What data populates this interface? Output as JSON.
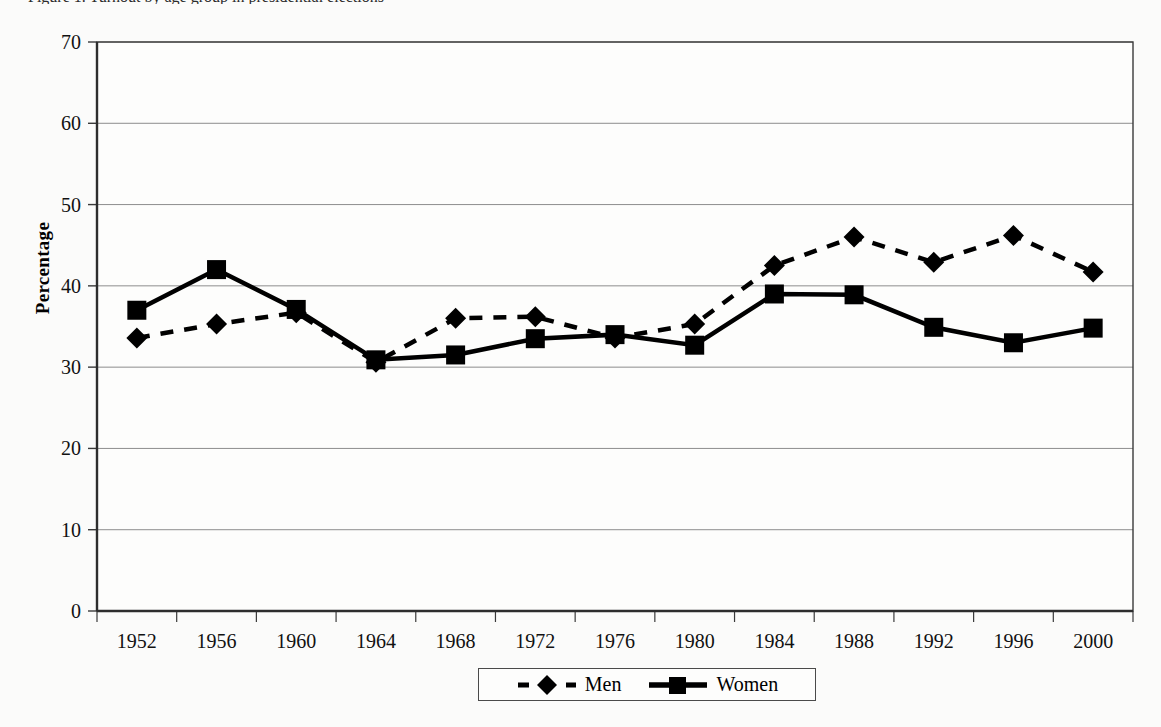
{
  "figure": {
    "title": "Figure 1. Turnout by age group in presidential elections"
  },
  "axes": {
    "y_title": "Percentage",
    "y_ticks": [
      "0",
      "10",
      "20",
      "30",
      "40",
      "50",
      "60",
      "70"
    ],
    "x_ticks": [
      "1952",
      "1956",
      "1960",
      "1964",
      "1968",
      "1972",
      "1976",
      "1980",
      "1984",
      "1988",
      "1992",
      "1996",
      "2000"
    ]
  },
  "legend": {
    "items": [
      {
        "label": "Men",
        "marker": "diamond-marker",
        "line": "dashed",
        "color": "#000000"
      },
      {
        "label": "Women",
        "marker": "square-marker",
        "line": "solid",
        "color": "#000000"
      }
    ]
  },
  "chart_data": {
    "type": "line",
    "title": "Figure 1. Turnout by age group in presidential elections",
    "xlabel": "",
    "ylabel": "Percentage",
    "ylim": [
      0,
      70
    ],
    "ytick_step": 10,
    "grid": true,
    "grid_axis": "y",
    "legend_position": "bottom",
    "categories": [
      1952,
      1956,
      1960,
      1964,
      1968,
      1972,
      1976,
      1980,
      1984,
      1988,
      1992,
      1996,
      2000
    ],
    "series": [
      {
        "name": "Men",
        "style": "dashed",
        "marker": "diamond",
        "color": "#000000",
        "values": [
          33.6,
          35.3,
          36.7,
          30.6,
          36.0,
          36.2,
          33.6,
          35.3,
          42.5,
          46.0,
          42.9,
          46.2,
          41.7
        ]
      },
      {
        "name": "Women",
        "style": "solid",
        "marker": "square",
        "color": "#000000",
        "values": [
          37.0,
          42.0,
          37.1,
          30.9,
          31.5,
          33.5,
          34.0,
          32.7,
          39.0,
          38.9,
          34.9,
          33.0,
          34.8
        ]
      }
    ]
  },
  "geometry": {
    "plot_left": 97,
    "plot_right": 1133,
    "plot_top": 42,
    "plot_bottom": 611
  },
  "colors": {
    "background": "#fbfbfa",
    "axis": "#3a3a3a",
    "grid": "#8d8d8d",
    "series": "#000000"
  }
}
